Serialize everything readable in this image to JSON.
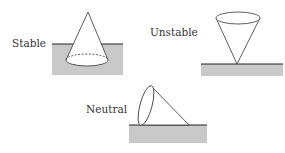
{
  "diagram": {
    "items": [
      {
        "label": "Stable",
        "description": "Cone resting on its base, base embedded below ground surface"
      },
      {
        "label": "Unstable",
        "description": "Cone balanced on its apex"
      },
      {
        "label": "Neutral",
        "description": "Cone lying on its side"
      }
    ],
    "colors": {
      "ground": "#c8c8c8",
      "line": "#222222",
      "fill": "#ffffff"
    }
  }
}
